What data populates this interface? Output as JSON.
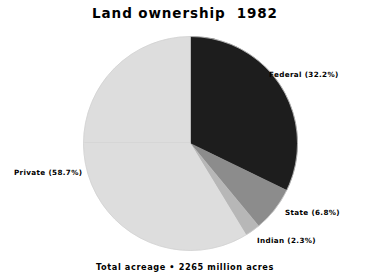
{
  "chart_data": {
    "type": "pie",
    "title": "Land ownership  1982",
    "footnote": "Total acreage • 2265 million acres",
    "xlabel": "",
    "ylabel": "",
    "legend_position": "outside-labels",
    "grid": false,
    "total_label": "Total acreage",
    "total_value": 2265,
    "total_units": "million acres",
    "start_angle_deg": 90,
    "direction": "clockwise",
    "categories": [
      "Federal",
      "State",
      "Indian",
      "Private"
    ],
    "values": [
      32.2,
      6.8,
      2.3,
      58.7
    ],
    "value_units": "percent",
    "colors": [
      "#1d1d1d",
      "#8c8c8c",
      "#b7b7b7",
      "#dddddd"
    ],
    "slices": [
      {
        "name": "Federal",
        "label": "Federal (32.2%)",
        "value": 32.2,
        "color": "#1d1d1d",
        "acres_million": 729
      },
      {
        "name": "State",
        "label": "State (6.8%)",
        "value": 6.8,
        "color": "#8c8c8c",
        "acres_million": 154
      },
      {
        "name": "Indian",
        "label": "Indian (2.3%)",
        "value": 2.3,
        "color": "#b7b7b7",
        "acres_million": 52
      },
      {
        "name": "Private",
        "label": "Private (58.7%)",
        "value": 58.7,
        "color": "#dddddd",
        "acres_million": 1330
      }
    ]
  },
  "figure": {
    "background_color": "#ffffff",
    "text_color": "#000000",
    "outline_color": "#cfcfcf"
  }
}
